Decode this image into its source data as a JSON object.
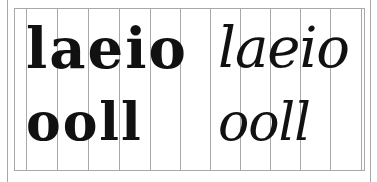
{
  "figure": {
    "colors": {
      "ink": "#111111",
      "grid": "#a8a8a8",
      "background": "#ffffff"
    },
    "panels": [
      {
        "name": "left",
        "style": "upright-broad-nib",
        "row1": "laeio",
        "row2": "ooll"
      },
      {
        "name": "right",
        "style": "slanted-pen",
        "row1": "laeio",
        "row2": "ooll"
      }
    ],
    "grid": {
      "outer_left_x": 7,
      "frame_left_x": 14,
      "frame_top_y": 8,
      "frame_bottom_y": 170,
      "vertical_xs": [
        26,
        57,
        88,
        119,
        150,
        180,
        210,
        240,
        270,
        300,
        330,
        361
      ],
      "frame_right_x": 364,
      "outer_right_x": 370
    }
  }
}
